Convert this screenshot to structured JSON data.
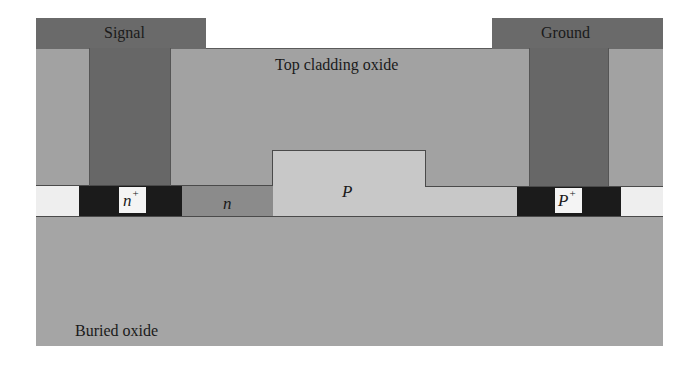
{
  "diagram": {
    "type": "device cross-section",
    "labels": {
      "signal": "Signal",
      "ground": "Ground",
      "top_cladding": "Top cladding oxide",
      "buried_oxide": "Buried oxide",
      "n_plus": "n",
      "n_plus_sup": "+",
      "n": "n",
      "p": "P",
      "p_plus": "P",
      "p_plus_sup": "+"
    },
    "regions": [
      {
        "name": "Signal electrode",
        "color": "#6a6a6a"
      },
      {
        "name": "Ground electrode",
        "color": "#6a6a6a"
      },
      {
        "name": "Top cladding oxide",
        "color": "#a2a2a2"
      },
      {
        "name": "n+ contact region",
        "color": "#1b1b1b"
      },
      {
        "name": "n region",
        "color": "#8b8b8b"
      },
      {
        "name": "P region (rib)",
        "color": "#c8c8c8"
      },
      {
        "name": "P+ contact region",
        "color": "#1b1b1b"
      },
      {
        "name": "Silicon slab (undoped)",
        "color": "#eeeeee"
      },
      {
        "name": "Buried oxide",
        "color": "#a5a5a5"
      }
    ]
  }
}
